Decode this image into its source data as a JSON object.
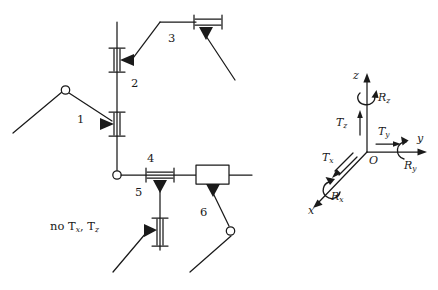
{
  "figure": {
    "stroke_color": "#1a1a1a",
    "fill_color": "#1a1a1a",
    "background": "#ffffff"
  },
  "mechanism": {
    "note": "no",
    "note_t1": "T",
    "note_t1_sub": "x",
    "note_comma": ",",
    "note_t2": "T",
    "note_t2_sub": "z",
    "joint_labels": [
      {
        "id": "joint-1",
        "text": "1",
        "x": 77,
        "y": 120,
        "type": "prismatic-vertical"
      },
      {
        "id": "joint-2",
        "text": "2",
        "x": 131,
        "y": 84,
        "type": "prismatic-vertical"
      },
      {
        "id": "joint-3",
        "text": "3",
        "x": 168,
        "y": 39,
        "type": "prismatic-horizontal"
      },
      {
        "id": "joint-4",
        "text": "4",
        "x": 147,
        "y": 159,
        "type": "prismatic-horizontal"
      },
      {
        "id": "joint-5",
        "text": "5",
        "x": 135,
        "y": 193,
        "type": "prismatic-vertical"
      },
      {
        "id": "joint-6",
        "text": "6",
        "x": 200,
        "y": 213,
        "type": "prismatic-block"
      }
    ]
  },
  "coordinate_frame": {
    "origin_label": "O",
    "axes": [
      {
        "id": "axis-z",
        "label": "z"
      },
      {
        "id": "axis-y",
        "label": "y"
      },
      {
        "id": "axis-x",
        "label": "x"
      }
    ],
    "translations": [
      {
        "id": "translation-x",
        "symbol": "T",
        "sub": "x"
      },
      {
        "id": "translation-y",
        "symbol": "T",
        "sub": "y"
      },
      {
        "id": "translation-z",
        "symbol": "T",
        "sub": "z"
      }
    ],
    "rotations": [
      {
        "id": "rotation-x",
        "symbol": "R",
        "sub": "x"
      },
      {
        "id": "rotation-y",
        "symbol": "R",
        "sub": "y"
      },
      {
        "id": "rotation-z",
        "symbol": "R",
        "sub": "z"
      }
    ]
  }
}
